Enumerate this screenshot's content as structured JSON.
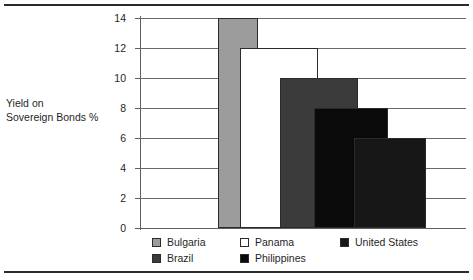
{
  "chart_data": {
    "type": "bar",
    "title": "",
    "xlabel": "",
    "ylabel": "Yield on Sovereign Bonds %",
    "ylabel_lines": [
      "Yield on",
      "Sovereign Bonds %"
    ],
    "ylim": [
      0,
      14
    ],
    "yticks": [
      0,
      2,
      4,
      6,
      8,
      10,
      12,
      14
    ],
    "ytick_labels": [
      "0",
      "2",
      "4",
      "6",
      "8",
      "10",
      "12",
      "14"
    ],
    "grid": true,
    "legend_position": "bottom",
    "categories": [
      "Bulgaria",
      "Panama",
      "Brazil",
      "Philippines",
      "United States"
    ],
    "values": [
      14,
      12,
      10,
      8,
      6
    ],
    "series": [
      {
        "name": "Bulgaria",
        "value": 14,
        "color": "#9c9c9c"
      },
      {
        "name": "Panama",
        "value": 12,
        "color": "#ffffff"
      },
      {
        "name": "Brazil",
        "value": 10,
        "color": "#3b3b3b"
      },
      {
        "name": "Philippines",
        "value": 8,
        "color": "#0a0a0a"
      },
      {
        "name": "United States",
        "value": 6,
        "color": "#171717"
      }
    ]
  },
  "legend": {
    "entries": [
      {
        "label": "Bulgaria",
        "color": "#9c9c9c"
      },
      {
        "label": "Panama",
        "color": "#ffffff"
      },
      {
        "label": "United States",
        "color": "#171717"
      },
      {
        "label": "Brazil",
        "color": "#3b3b3b"
      },
      {
        "label": "Philippines",
        "color": "#0a0a0a"
      }
    ]
  }
}
